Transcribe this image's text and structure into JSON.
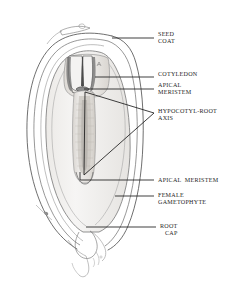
{
  "diagram": {
    "type": "botanical-line-drawing",
    "colors": {
      "ink": "#3a3a3a",
      "ink_dark": "#1a1a1a",
      "shade_light": "#f0efed",
      "shade_mid": "#e2e0dd",
      "shade_dark": "#cfcbc6",
      "background": "#ffffff",
      "leader": "#1c1c1c"
    },
    "labels": [
      {
        "id": "seed-coat",
        "lines": [
          "SEED",
          "COAT"
        ],
        "text": "SEED COAT",
        "x": 158,
        "y": 33,
        "leader": {
          "x1": 112,
          "y1": 38,
          "x2": 154,
          "y2": 38
        }
      },
      {
        "id": "cotyledon",
        "lines": [
          "COTYLEDON"
        ],
        "text": "COTYLEDON",
        "x": 158,
        "y": 73,
        "leader": {
          "x1": 95,
          "y1": 77,
          "x2": 154,
          "y2": 77
        }
      },
      {
        "id": "apical-meristem-upper",
        "lines": [
          "APICAL",
          "MERISTEM"
        ],
        "text": "APICAL MERISTEM",
        "x": 158,
        "y": 84,
        "leader": {
          "x1": 84,
          "y1": 89,
          "x2": 154,
          "y2": 89
        }
      },
      {
        "id": "hypocotyl-root-axis",
        "lines": [
          "HYPOCOTYL-ROOT",
          "AXIS"
        ],
        "text": "HYPOCOTYL-ROOT AXIS",
        "x": 158,
        "y": 110,
        "leader": {
          "x1": 0,
          "y1": 0,
          "x2": 0,
          "y2": 0
        }
      },
      {
        "id": "apical-meristem-lower",
        "lines": [
          "APICAL  MERISTEM"
        ],
        "text": "APICAL MERISTEM",
        "x": 158,
        "y": 175,
        "leader": {
          "x1": 80,
          "y1": 180,
          "x2": 154,
          "y2": 180
        }
      },
      {
        "id": "female-gametophyte",
        "lines": [
          "FEMALE",
          "GAMETOPHYTE"
        ],
        "text": "FEMALE GAMETOPHYTE",
        "x": 158,
        "y": 191,
        "leader": {
          "x1": 115,
          "y1": 196,
          "x2": 154,
          "y2": 196
        }
      },
      {
        "id": "root-cap",
        "lines": [
          "ROOT",
          "CAP"
        ],
        "text": "ROOT CAP",
        "x": 160,
        "y": 222,
        "leader": {
          "x1": 86,
          "y1": 227,
          "x2": 156,
          "y2": 227
        }
      }
    ],
    "structures": [
      {
        "id": "seed-coat-outline",
        "name": "seed coat"
      },
      {
        "id": "female-gametophyte-body",
        "name": "female gametophyte"
      },
      {
        "id": "cotyledons",
        "name": "cotyledons"
      },
      {
        "id": "embryo-axis",
        "name": "hypocotyl-root axis"
      },
      {
        "id": "root-cap-tip",
        "name": "root cap"
      },
      {
        "id": "micropylar-tail",
        "name": "micropylar end"
      }
    ]
  }
}
